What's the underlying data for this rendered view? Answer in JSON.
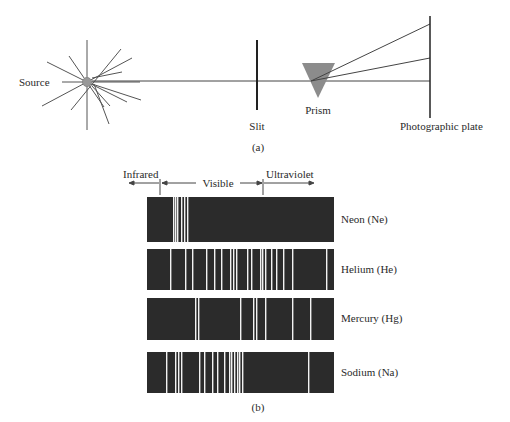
{
  "figure_a": {
    "source_label": "Source",
    "slit_label": "Slit",
    "prism_label": "Prism",
    "plate_label": "Photographic plate",
    "caption": "(a)"
  },
  "figure_b": {
    "regions": {
      "infrared": "Infrared",
      "visible": "Visible",
      "ultraviolet": "Ultraviolet"
    },
    "caption": "(b)",
    "spectra": [
      {
        "label": "Neon (Ne)",
        "lines": [
          173,
          175,
          177,
          181,
          184,
          187
        ]
      },
      {
        "label": "Helium (He)",
        "lines": [
          170,
          185,
          192,
          206,
          214,
          221,
          230,
          233,
          236,
          247,
          251,
          260,
          262,
          265,
          271,
          276,
          283,
          292,
          326
        ]
      },
      {
        "label": "Mercury (Hg)",
        "lines": [
          195,
          198,
          240,
          253,
          256,
          265,
          292,
          310
        ]
      },
      {
        "label": "Sodium (Na)",
        "lines": [
          166,
          175,
          178,
          181,
          199,
          204,
          212,
          217,
          224,
          229,
          231,
          234,
          237,
          239,
          242,
          308
        ]
      }
    ],
    "colors": {
      "band": "#2b2b2b",
      "line": "#f2f2f2"
    }
  }
}
